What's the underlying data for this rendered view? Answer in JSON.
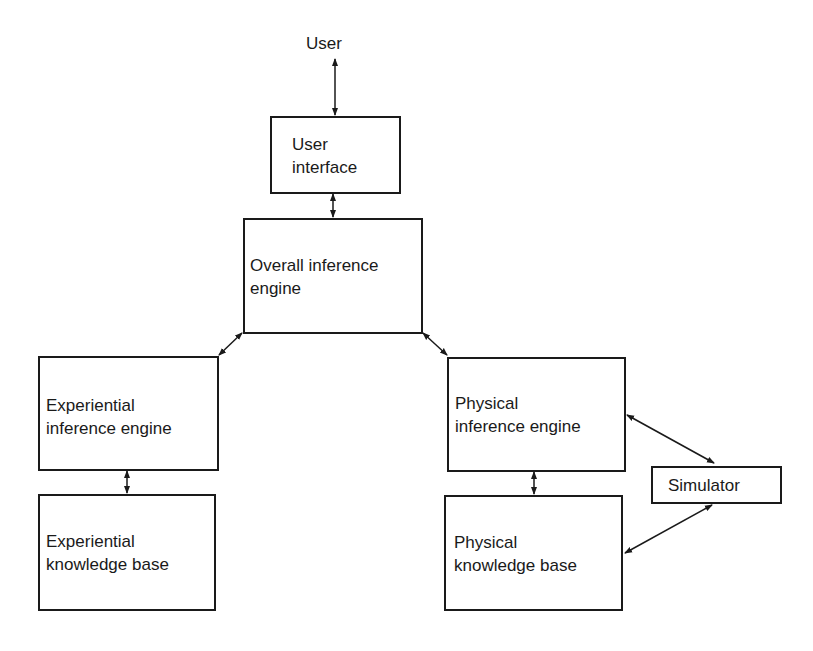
{
  "diagram": {
    "nodes": {
      "user": {
        "label": "User"
      },
      "user_interface": {
        "line1": "User",
        "line2": "interface"
      },
      "overall_engine": {
        "line1": "Overall inference",
        "line2": "engine"
      },
      "exp_engine": {
        "line1": "Experiential",
        "line2": "inference engine"
      },
      "exp_kb": {
        "line1": "Experiential",
        "line2": "knowledge base"
      },
      "phys_engine": {
        "line1": "Physical",
        "line2": "inference engine"
      },
      "phys_kb": {
        "line1": "Physical",
        "line2": "knowledge base"
      },
      "simulator": {
        "label": "Simulator"
      }
    },
    "edges": [
      {
        "from": "user",
        "to": "user_interface",
        "type": "bidirectional"
      },
      {
        "from": "user_interface",
        "to": "overall_engine",
        "type": "bidirectional"
      },
      {
        "from": "overall_engine",
        "to": "exp_engine",
        "type": "bidirectional"
      },
      {
        "from": "overall_engine",
        "to": "phys_engine",
        "type": "bidirectional"
      },
      {
        "from": "exp_engine",
        "to": "exp_kb",
        "type": "bidirectional"
      },
      {
        "from": "phys_engine",
        "to": "phys_kb",
        "type": "bidirectional"
      },
      {
        "from": "phys_engine",
        "to": "simulator",
        "type": "bidirectional"
      },
      {
        "from": "phys_kb",
        "to": "simulator",
        "type": "bidirectional"
      }
    ]
  }
}
